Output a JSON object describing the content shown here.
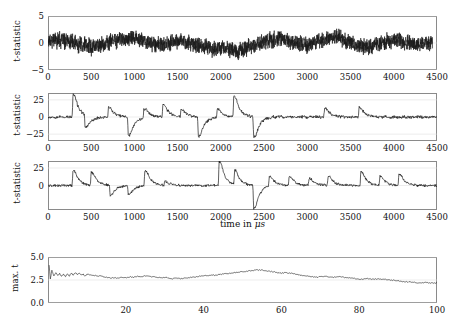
{
  "figure": {
    "background": "#ffffff",
    "line_color": "#1a1a1a",
    "frame_color": "#8a8a8a",
    "grid_color": "#d8d8d8"
  },
  "chart_data": [
    {
      "id": "panel-1",
      "type": "line",
      "title": "",
      "xlabel": "",
      "ylabel": "t-statistic",
      "xlim": [
        0,
        4500
      ],
      "ylim": [
        -5,
        5
      ],
      "xticks": [
        0,
        500,
        1000,
        1500,
        2000,
        2500,
        3000,
        3500,
        4000,
        4500
      ],
      "xticklabels": [
        "0",
        "500",
        "1000",
        "1500",
        "2000",
        "2500",
        "3000",
        "3500",
        "4000",
        "4500"
      ],
      "yticks": [
        -5,
        0,
        5
      ],
      "yticklabels": [
        "-5",
        "0",
        "5"
      ],
      "grid": true,
      "legend": "none",
      "description": "dense broadband noise trace oscillating about zero, amplitude mostly within +/-2",
      "series": [
        {
          "name": "raw t-statistic",
          "x": [
            0,
            25,
            50,
            75,
            100,
            125,
            150,
            175,
            200,
            225,
            250,
            275,
            300,
            325,
            350,
            375,
            400,
            425,
            450,
            475,
            500,
            525,
            550,
            575,
            600,
            625,
            650,
            675,
            700,
            725,
            750,
            775,
            800,
            825,
            850,
            875,
            900,
            925,
            950,
            975,
            1000,
            1025,
            1050,
            1075,
            1100,
            1125,
            1150,
            1175,
            1200,
            1225,
            1250,
            1275,
            1300,
            1325,
            1350,
            1375,
            1400,
            1425,
            1450,
            1475,
            1500,
            1525,
            1550,
            1575,
            1600,
            1625,
            1650,
            1675,
            1700,
            1725,
            1750,
            1775,
            1800,
            1825,
            1850,
            1875,
            1900,
            1925,
            1950,
            1975,
            2000,
            2025,
            2050,
            2075,
            2100,
            2125,
            2150,
            2175,
            2200,
            2225,
            2250,
            2275,
            2300,
            2325,
            2350,
            2375,
            2400,
            2425,
            2450,
            2475,
            2500,
            2525,
            2550,
            2575,
            2600,
            2625,
            2650,
            2675,
            2700,
            2725,
            2750,
            2775,
            2800,
            2825,
            2850,
            2875,
            2900,
            2925,
            2950,
            2975,
            3000,
            3025,
            3050,
            3075,
            3100,
            3125,
            3150,
            3175,
            3200,
            3225,
            3250,
            3275,
            3300,
            3325,
            3350,
            3375,
            3400,
            3425,
            3450,
            3475,
            3500,
            3525,
            3550,
            3575,
            3600,
            3625,
            3650,
            3675,
            3700,
            3725,
            3750,
            3775,
            3800,
            3825,
            3850,
            3875,
            3900,
            3925,
            3950,
            3975,
            4000,
            4025,
            4050,
            4075,
            4100,
            4125,
            4150,
            4175,
            4200,
            4225,
            4250,
            4275,
            4300,
            4325,
            4350,
            4375,
            4400,
            4425,
            4450,
            4475,
            4500
          ],
          "y": [
            0.4,
            0.8,
            0.2,
            0.9,
            0.3,
            1.0,
            0.2,
            0.7,
            0.1,
            0.6,
            -0.1,
            0.5,
            -0.3,
            0.2,
            -0.5,
            0.0,
            -0.6,
            -0.2,
            -0.8,
            -0.3,
            -0.9,
            -0.4,
            -0.7,
            -0.2,
            -0.6,
            0.0,
            -0.4,
            0.3,
            -0.2,
            0.5,
            0.1,
            0.7,
            0.3,
            0.8,
            0.4,
            0.9,
            0.5,
            1.1,
            0.6,
            1.2,
            0.7,
            1.0,
            0.4,
            0.8,
            0.2,
            0.5,
            0.0,
            0.3,
            -0.2,
            0.1,
            -0.4,
            -0.1,
            -0.6,
            -0.2,
            -0.5,
            0.0,
            -0.3,
            0.2,
            -0.1,
            0.4,
            0.1,
            0.6,
            0.2,
            0.5,
            0.0,
            0.3,
            -0.3,
            0.0,
            -0.5,
            -0.2,
            -0.7,
            -0.3,
            -0.9,
            -0.5,
            -1.1,
            -0.6,
            -1.3,
            -0.7,
            -1.2,
            -0.5,
            -1.0,
            -0.4,
            -1.4,
            -0.6,
            -1.6,
            -0.8,
            -1.8,
            -1.0,
            -2.0,
            -1.1,
            -1.7,
            -0.9,
            -1.3,
            -0.5,
            -0.9,
            -0.2,
            -0.5,
            0.1,
            -0.2,
            0.4,
            0.0,
            0.6,
            0.2,
            0.8,
            0.3,
            0.9,
            0.4,
            1.0,
            0.5,
            0.8,
            0.2,
            0.6,
            0.1,
            0.4,
            -0.1,
            0.3,
            -0.2,
            0.1,
            -0.4,
            0.0,
            -0.5,
            -0.1,
            -0.3,
            0.2,
            -0.1,
            0.5,
            0.2,
            0.8,
            0.4,
            1.1,
            0.6,
            1.4,
            0.8,
            1.6,
            0.9,
            1.3,
            0.5,
            0.9,
            0.2,
            0.5,
            -0.1,
            0.2,
            -0.4,
            -0.1,
            -0.6,
            -0.3,
            -0.8,
            -0.4,
            -0.9,
            -0.5,
            -0.7,
            -0.2,
            -0.5,
            0.0,
            -0.3,
            0.2,
            0.0,
            0.4,
            0.1,
            0.5,
            0.2,
            0.6,
            0.3,
            0.5,
            0.1,
            0.3,
            -0.1,
            0.1,
            -0.3,
            0.0,
            -0.4,
            -0.1,
            -0.5,
            -0.2,
            -0.3,
            0.0,
            -0.2,
            0.1,
            0.0
          ]
        }
      ]
    },
    {
      "id": "panel-2",
      "type": "line",
      "title": "",
      "xlabel": "",
      "ylabel": "t-statistic",
      "xlim": [
        0,
        4500
      ],
      "ylim": [
        -35,
        35
      ],
      "xticks": [
        0,
        500,
        1000,
        1500,
        2000,
        2500,
        3000,
        3500,
        4000,
        4500
      ],
      "xticklabels": [
        "0",
        "500",
        "1000",
        "1500",
        "2000",
        "2500",
        "3000",
        "3500",
        "4000",
        "4500"
      ],
      "yticks": [
        -25,
        0,
        25
      ],
      "yticklabels": [
        "-25",
        "0",
        "25"
      ],
      "grid": true,
      "legend": "none",
      "description": "filtered t-statistic with large bipolar spike transients, positive excursions up to ~33 and negative down to ~-30",
      "events": [
        {
          "time": 290,
          "amplitude": 33,
          "polarity": "positive"
        },
        {
          "time": 430,
          "amplitude": -18,
          "polarity": "negative"
        },
        {
          "time": 700,
          "amplitude": 14,
          "polarity": "positive"
        },
        {
          "time": 930,
          "amplitude": -28,
          "polarity": "negative"
        },
        {
          "time": 1110,
          "amplitude": 13,
          "polarity": "positive"
        },
        {
          "time": 1330,
          "amplitude": 19,
          "polarity": "positive"
        },
        {
          "time": 1540,
          "amplitude": 11,
          "polarity": "positive"
        },
        {
          "time": 1740,
          "amplitude": -30,
          "polarity": "negative"
        },
        {
          "time": 1960,
          "amplitude": 12,
          "polarity": "positive"
        },
        {
          "time": 2150,
          "amplitude": 31,
          "polarity": "positive"
        },
        {
          "time": 2380,
          "amplitude": -30,
          "polarity": "negative"
        },
        {
          "time": 3200,
          "amplitude": 13,
          "polarity": "positive"
        },
        {
          "time": 3600,
          "amplitude": 14,
          "polarity": "positive"
        }
      ]
    },
    {
      "id": "panel-3",
      "type": "line",
      "title": "",
      "xlabel": "time in μs",
      "ylabel": "t-statistic",
      "xlim": [
        0,
        4500
      ],
      "ylim": [
        -35,
        35
      ],
      "xticks": [
        0,
        500,
        1000,
        1500,
        2000,
        2500,
        3000,
        3500,
        4000,
        4500
      ],
      "xticklabels": [
        "0",
        "500",
        "1000",
        "1500",
        "2000",
        "2500",
        "3000",
        "3500",
        "4000",
        "4500"
      ],
      "yticks": [
        0,
        25
      ],
      "yticklabels": [
        "0",
        "25"
      ],
      "grid": true,
      "legend": "none",
      "description": "rectified/whitened t-statistic, predominantly positive spike transients reaching ~22-35",
      "events": [
        {
          "time": 290,
          "amplitude": 22,
          "polarity": "positive"
        },
        {
          "time": 500,
          "amplitude": 19,
          "polarity": "positive"
        },
        {
          "time": 720,
          "amplitude": -14,
          "polarity": "negative"
        },
        {
          "time": 930,
          "amplitude": -13,
          "polarity": "negative"
        },
        {
          "time": 1120,
          "amplitude": 22,
          "polarity": "positive"
        },
        {
          "time": 1350,
          "amplitude": 6,
          "polarity": "positive"
        },
        {
          "time": 1980,
          "amplitude": 35,
          "polarity": "positive"
        },
        {
          "time": 2160,
          "amplitude": 21,
          "polarity": "positive"
        },
        {
          "time": 2380,
          "amplitude": -33,
          "polarity": "negative"
        },
        {
          "time": 2560,
          "amplitude": 14,
          "polarity": "positive"
        },
        {
          "time": 2790,
          "amplitude": 13,
          "polarity": "positive"
        },
        {
          "time": 3020,
          "amplitude": 10,
          "polarity": "positive"
        },
        {
          "time": 3240,
          "amplitude": 13,
          "polarity": "positive"
        },
        {
          "time": 3620,
          "amplitude": 20,
          "polarity": "positive"
        },
        {
          "time": 3840,
          "amplitude": 14,
          "polarity": "positive"
        },
        {
          "time": 4060,
          "amplitude": 16,
          "polarity": "positive"
        }
      ]
    },
    {
      "id": "panel-4",
      "type": "line",
      "title": "",
      "xlabel": "",
      "ylabel": "max. t",
      "xlim": [
        0,
        100
      ],
      "ylim": [
        0.0,
        5.0
      ],
      "xticks": [
        20,
        40,
        60,
        80,
        100
      ],
      "xticklabels": [
        "20",
        "40",
        "60",
        "80",
        "100"
      ],
      "yticks": [
        0.0,
        2.5,
        5.0
      ],
      "yticklabels": [
        "0.0",
        "2.5",
        "5.0"
      ],
      "grid": true,
      "legend": "none",
      "description": "maximum t value per iteration, starts with a sharp transient near 4.1 then fluctuates between 2.1 and 3.7",
      "series": [
        {
          "name": "max t",
          "x": [
            0.3,
            0.6,
            1,
            1.5,
            2,
            2.5,
            3,
            3.5,
            4,
            4.5,
            5,
            5.5,
            6,
            6.5,
            7,
            7.5,
            8,
            8.5,
            9,
            9.5,
            10,
            11,
            12,
            13,
            14,
            15,
            16,
            17,
            18,
            19,
            20,
            21,
            22,
            23,
            24,
            25,
            26,
            27,
            28,
            29,
            30,
            31,
            32,
            33,
            34,
            35,
            36,
            37,
            38,
            39,
            40,
            41,
            42,
            43,
            44,
            45,
            46,
            47,
            48,
            49,
            50,
            51,
            52,
            53,
            54,
            55,
            56,
            57,
            58,
            59,
            60,
            61,
            62,
            63,
            64,
            65,
            66,
            67,
            68,
            69,
            70,
            71,
            72,
            73,
            74,
            75,
            76,
            77,
            78,
            79,
            80,
            81,
            82,
            83,
            84,
            85,
            86,
            87,
            88,
            89,
            90,
            91,
            92,
            93,
            94,
            95,
            96,
            97,
            98,
            99,
            100
          ],
          "y": [
            4.1,
            2.6,
            3.6,
            2.9,
            3.3,
            3.0,
            3.2,
            2.9,
            3.1,
            2.9,
            3.15,
            2.95,
            3.25,
            3.05,
            3.3,
            3.1,
            3.25,
            3.05,
            3.15,
            2.95,
            3.1,
            3.05,
            3.0,
            2.95,
            2.9,
            2.8,
            2.7,
            2.75,
            2.7,
            2.8,
            2.75,
            2.85,
            2.8,
            2.9,
            2.85,
            2.95,
            2.9,
            2.85,
            2.8,
            2.75,
            2.8,
            2.7,
            2.65,
            2.7,
            2.65,
            2.7,
            2.75,
            2.8,
            2.85,
            2.9,
            2.95,
            3.0,
            3.05,
            3.0,
            3.1,
            3.15,
            3.2,
            3.25,
            3.3,
            3.35,
            3.4,
            3.45,
            3.5,
            3.55,
            3.6,
            3.55,
            3.5,
            3.45,
            3.4,
            3.3,
            3.25,
            3.3,
            3.25,
            3.2,
            3.1,
            3.0,
            2.95,
            2.9,
            2.85,
            2.8,
            2.85,
            2.9,
            2.85,
            2.8,
            2.8,
            2.85,
            2.8,
            2.75,
            2.7,
            2.65,
            2.6,
            2.6,
            2.65,
            2.6,
            2.6,
            2.6,
            2.6,
            2.55,
            2.5,
            2.45,
            2.4,
            2.35,
            2.3,
            2.3,
            2.25,
            2.2,
            2.2,
            2.25,
            2.2,
            2.15,
            2.2
          ]
        }
      ]
    }
  ]
}
